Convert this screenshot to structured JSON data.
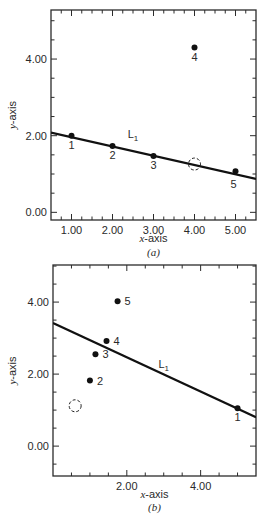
{
  "chart_data": [
    {
      "type": "scatter",
      "panel": "(a)",
      "title": "",
      "xlabel": "x-axis",
      "ylabel": "y-axis",
      "xlim": [
        0.5,
        5.5
      ],
      "ylim": [
        -0.2,
        5.28
      ],
      "xticks": [
        1.0,
        2.0,
        3.0,
        4.0,
        5.0
      ],
      "xtick_labels": [
        "1.00",
        "2.00",
        "3.00",
        "4.00",
        "5.00"
      ],
      "yticks": [
        0.0,
        2.0,
        4.0
      ],
      "ytick_labels": [
        "0.00",
        "2.00",
        "4.00"
      ],
      "grid": false,
      "points": [
        {
          "label": "1",
          "x": 1.0,
          "y": 2.0
        },
        {
          "label": "2",
          "x": 2.0,
          "y": 1.73
        },
        {
          "label": "3",
          "x": 3.0,
          "y": 1.47
        },
        {
          "label": "4",
          "x": 4.0,
          "y": 4.3
        },
        {
          "label": "5",
          "x": 5.0,
          "y": 1.07
        }
      ],
      "open_circle": {
        "x": 4.0,
        "y": 1.26
      },
      "line": {
        "name": "L",
        "subscript": "1",
        "x1": 0.5,
        "y1": 2.08,
        "x2": 5.5,
        "y2": 0.87,
        "label_x": 2.5,
        "label_y": 1.95
      }
    },
    {
      "type": "scatter",
      "panel": "(b)",
      "title": "",
      "xlabel": "x-axis",
      "ylabel": "y-axis",
      "xlim": [
        0.0,
        5.5
      ],
      "ylim": [
        -0.83,
        5.03
      ],
      "xticks": [
        2.0,
        4.0
      ],
      "xtick_labels": [
        "2.00",
        "4.00"
      ],
      "yticks": [
        0.0,
        2.0,
        4.0
      ],
      "ytick_labels": [
        "0.00",
        "2.00",
        "4.00"
      ],
      "grid": false,
      "points": [
        {
          "label": "1",
          "x": 5.0,
          "y": 1.05
        },
        {
          "label": "2",
          "x": 1.0,
          "y": 1.82
        },
        {
          "label": "3",
          "x": 1.15,
          "y": 2.55
        },
        {
          "label": "4",
          "x": 1.45,
          "y": 2.92
        },
        {
          "label": "5",
          "x": 1.75,
          "y": 4.02
        }
      ],
      "open_circle": {
        "x": 0.6,
        "y": 1.12
      },
      "line": {
        "name": "L",
        "subscript": "1",
        "x1": 0.0,
        "y1": 3.42,
        "x2": 5.5,
        "y2": 0.8,
        "label_x": 3.0,
        "label_y": 2.18
      }
    }
  ],
  "panels": {
    "a": {
      "label": "(a)",
      "xlabel": "x-axis",
      "ylabel": "y-axis",
      "line_label": "L",
      "line_sub": "1"
    },
    "b": {
      "label": "(b)",
      "xlabel": "x-axis",
      "ylabel": "y-axis",
      "line_label": "L",
      "line_sub": "1"
    }
  }
}
